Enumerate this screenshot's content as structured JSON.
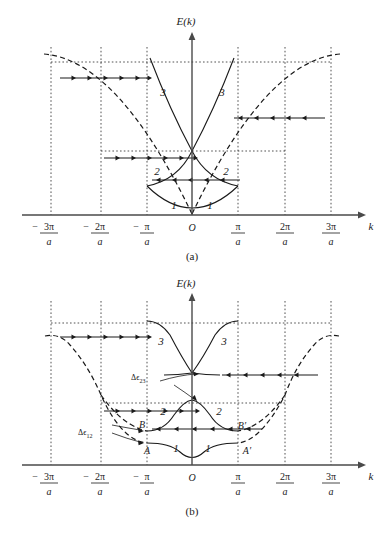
{
  "figure": {
    "panels": [
      {
        "id": "a",
        "caption": "(a)",
        "description": "Free-electron parabola folded into Brillouin zones, no band gaps",
        "axis": {
          "y_label": "E(k)",
          "x_label": "k",
          "origin_label": "O"
        },
        "ticks": [
          {
            "num": "3π",
            "den": "a",
            "sign": "−"
          },
          {
            "num": "2π",
            "den": "a",
            "sign": "−"
          },
          {
            "num": "π",
            "den": "a",
            "sign": "−"
          },
          {
            "num": "π",
            "den": "a",
            "sign": ""
          },
          {
            "num": "2π",
            "den": "a",
            "sign": ""
          },
          {
            "num": "3π",
            "den": "a",
            "sign": ""
          }
        ],
        "band_labels": [
          "1",
          "1",
          "2",
          "2",
          "3",
          "3"
        ]
      },
      {
        "id": "b",
        "caption": "(b)",
        "description": "Nearly-free-electron bands with energy gaps opening at zone boundaries",
        "axis": {
          "y_label": "E(k)",
          "x_label": "k",
          "origin_label": "O"
        },
        "ticks": [
          {
            "num": "3π",
            "den": "a",
            "sign": "−"
          },
          {
            "num": "2π",
            "den": "a",
            "sign": "−"
          },
          {
            "num": "π",
            "den": "a",
            "sign": "−"
          },
          {
            "num": "π",
            "den": "a",
            "sign": ""
          },
          {
            "num": "2π",
            "den": "a",
            "sign": ""
          },
          {
            "num": "3π",
            "den": "a",
            "sign": ""
          }
        ],
        "band_labels": [
          "1",
          "1",
          "2",
          "2",
          "3",
          "3"
        ],
        "gap_labels": [
          {
            "id": "gap-23",
            "sym": "Δϵ",
            "sub": "23"
          },
          {
            "id": "gap-12",
            "sym": "Δϵ",
            "sub": "12"
          }
        ],
        "point_labels": [
          "A",
          "B",
          "A′",
          "B′"
        ]
      }
    ],
    "colors": {
      "curve": "#1a1a1a",
      "axis": "#4a4a4a",
      "grid": "#1a1a1a",
      "background": "#ffffff"
    }
  }
}
